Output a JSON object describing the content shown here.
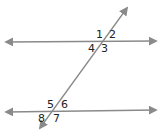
{
  "diagram": {
    "type": "parallel-lines-cut-by-transversal",
    "colors": {
      "line": "#8a8a8a",
      "label": "#222222",
      "background": "#ffffff"
    },
    "lines": {
      "top": {
        "x1": 6,
        "y1": 42,
        "x2": 156,
        "y2": 41
      },
      "bottom": {
        "x1": 6,
        "y1": 112,
        "x2": 156,
        "y2": 110
      },
      "transversal": {
        "x1": 40,
        "y1": 128,
        "x2": 127,
        "y2": 8
      }
    },
    "angles": [
      {
        "id": "1",
        "label": "1",
        "x": 96,
        "y": 29
      },
      {
        "id": "2",
        "label": "2",
        "x": 109,
        "y": 29
      },
      {
        "id": "3",
        "label": "3",
        "x": 101,
        "y": 43
      },
      {
        "id": "4",
        "label": "4",
        "x": 88,
        "y": 43
      },
      {
        "id": "5",
        "label": "5",
        "x": 47,
        "y": 99
      },
      {
        "id": "6",
        "label": "6",
        "x": 61,
        "y": 99
      },
      {
        "id": "7",
        "label": "7",
        "x": 53,
        "y": 113
      },
      {
        "id": "8",
        "label": "8",
        "x": 38,
        "y": 113
      }
    ]
  }
}
